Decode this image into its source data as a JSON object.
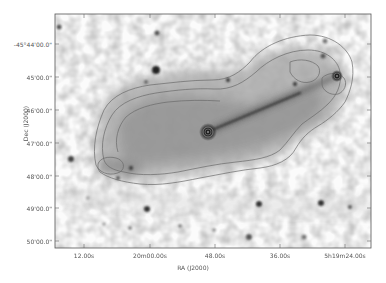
{
  "figure": {
    "type": "astronomical image with radio contours",
    "colormap": "grayscale inverted",
    "contour_color": "#6a6a6a",
    "background_color": "#ffffff",
    "frame_color": "#555555"
  },
  "axes": {
    "xlabel": "RA (J2000)",
    "ylabel": "Dec (J2000)",
    "xticks": [
      {
        "label": "12.00s",
        "x": 84
      },
      {
        "label": "20m00.00s",
        "x": 150
      },
      {
        "label": "48.00s",
        "x": 215
      },
      {
        "label": "36.00s",
        "x": 280
      },
      {
        "label": "5h19m24.00s",
        "x": 345
      }
    ],
    "yticks": [
      {
        "label": "-45°44'00.0\"",
        "y": 44
      },
      {
        "label": "45'00.0\"",
        "y": 77
      },
      {
        "label": "46'00.0\"",
        "y": 110
      },
      {
        "label": "47'00.0\"",
        "y": 143
      },
      {
        "label": "48'00.0\"",
        "y": 176
      },
      {
        "label": "49'00.0\"",
        "y": 208
      },
      {
        "label": "50'00.0\"",
        "y": 241
      }
    ]
  },
  "features": {
    "core": {
      "x": 208,
      "y": 132
    },
    "hotspot": {
      "x": 337,
      "y": 76
    },
    "jet": {
      "from": [
        208,
        132
      ],
      "to": [
        337,
        76
      ]
    }
  }
}
